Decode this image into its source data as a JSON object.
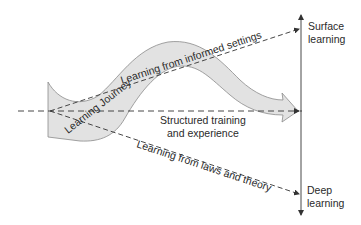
{
  "diagram": {
    "band_label": "Learning Journey",
    "horizontal_path_label_line1": "Structured training",
    "horizontal_path_label_line2": "and experience",
    "upper_path_label": "Learning from informed settings",
    "lower_path_label": "Learning from laws and theory",
    "axis_top_label_line1": "Surface",
    "axis_top_label_line2": "learning",
    "axis_bottom_label_line1": "Deep",
    "axis_bottom_label_line2": "learning"
  },
  "colors": {
    "band_fill": "#e2e2e2",
    "band_stroke": "#8a8a8a",
    "line": "#333333",
    "text": "#2a2a2a",
    "background": "#ffffff"
  }
}
